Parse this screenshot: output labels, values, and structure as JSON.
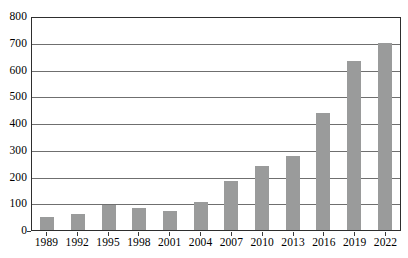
{
  "chart_data": {
    "type": "bar",
    "title": "",
    "subtitle": "",
    "xlabel": "",
    "ylabel": "",
    "categories": [
      "1989",
      "1992",
      "1995",
      "1998",
      "2001",
      "2004",
      "2007",
      "2010",
      "2013",
      "2016",
      "2019",
      "2022"
    ],
    "values": [
      50,
      60,
      93,
      82,
      71,
      104,
      183,
      238,
      275,
      437,
      630,
      700
    ],
    "series": [
      {
        "name": "",
        "values": [
          50,
          60,
          93,
          82,
          71,
          104,
          183,
          238,
          275,
          437,
          630,
          700
        ]
      }
    ],
    "ylim": [
      0,
      800
    ],
    "ytick_step": 100,
    "ytick_labels": [
      "800",
      "700",
      "600",
      "500",
      "400",
      "300",
      "200",
      "100",
      "0"
    ],
    "ytick_values": [
      800,
      700,
      600,
      500,
      400,
      300,
      200,
      100,
      0
    ],
    "xlim_labels": [
      "1989",
      "2022"
    ],
    "grid": "horizontal",
    "legend": "none",
    "legend_position": "none",
    "bar_color": "#9a9b9b",
    "gridline_color": "#6f6f6f",
    "axis_color": "#2e2e2e",
    "background_color": "#ffffff",
    "annotations": []
  }
}
